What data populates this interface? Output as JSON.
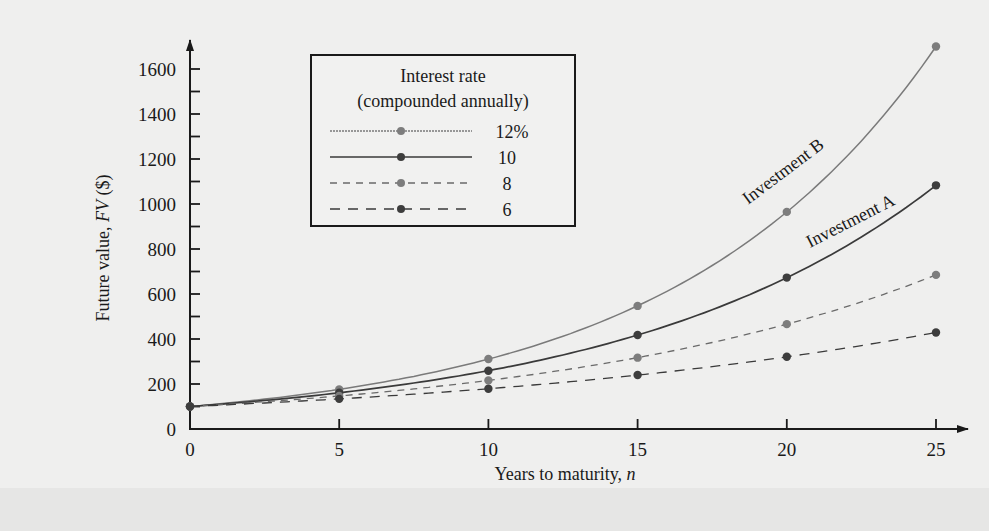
{
  "chart_data": {
    "type": "line",
    "title": "",
    "xlabel": "Years to maturity, n",
    "xlabel_parts": {
      "text": "Years to maturity, ",
      "italic": "n"
    },
    "ylabel": "Future value, FV ($)",
    "ylabel_parts": {
      "pre": "Future value, ",
      "italic": "FV",
      "post": " ($)"
    },
    "x": [
      0,
      5,
      10,
      15,
      20,
      25
    ],
    "x_ticks": [
      "0",
      "5",
      "10",
      "15",
      "20",
      "25"
    ],
    "y_ticks": [
      "0",
      "200",
      "400",
      "600",
      "800",
      "1000",
      "1200",
      "1400",
      "1600"
    ],
    "y_tick_values": [
      0,
      200,
      400,
      600,
      800,
      1000,
      1200,
      1400,
      1600
    ],
    "xlim": [
      0,
      25
    ],
    "ylim": [
      0,
      1600
    ],
    "grid": false,
    "legend_position": "upper-left (inside plot)",
    "legend": {
      "title_line1": "Interest rate",
      "title_line2": "(compounded annually)",
      "entries": [
        "12%",
        "10",
        "8",
        "6"
      ]
    },
    "series": [
      {
        "name": "12%",
        "style": "solid-light",
        "color": "#7a7a7a",
        "values": [
          100,
          176,
          311,
          547,
          965,
          1700
        ]
      },
      {
        "name": "10%",
        "style": "solid-dark",
        "color": "#3a3a3a",
        "values": [
          100,
          161,
          259,
          418,
          673,
          1083
        ]
      },
      {
        "name": "8%",
        "style": "dashed-short",
        "color": "#6a6a6a",
        "values": [
          100,
          147,
          216,
          317,
          466,
          685
        ]
      },
      {
        "name": "6%",
        "style": "dashed-long",
        "color": "#3a3a3a",
        "values": [
          100,
          134,
          179,
          240,
          321,
          429
        ]
      }
    ],
    "annotations": [
      {
        "text": "Investment B",
        "series": "12%"
      },
      {
        "text": "Investment A",
        "series": "10%"
      }
    ]
  },
  "colors": {
    "background": "#efefee",
    "axis": "#1a1a1a",
    "marker_light": "#7d7d7d",
    "marker_dark": "#3d3d3d"
  }
}
